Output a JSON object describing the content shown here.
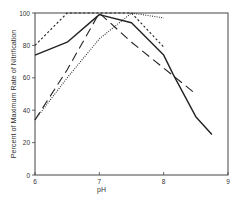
{
  "chart_data": {
    "type": "line",
    "title": "",
    "xlabel": "pH",
    "ylabel": "Percent of Maximum Rate of Nitrification",
    "xlim": [
      6,
      9
    ],
    "ylim": [
      0,
      100
    ],
    "xticks": [
      6,
      7,
      8,
      9
    ],
    "yticks": [
      0,
      20,
      40,
      60,
      80,
      100
    ],
    "grid": false,
    "legend": null,
    "series": [
      {
        "name": "solid",
        "style": "solid",
        "x": [
          6,
          6.5,
          7,
          7.5,
          8,
          8.15,
          8.5,
          8.75
        ],
        "values": [
          74,
          82,
          99,
          94,
          74,
          62,
          36,
          25
        ]
      },
      {
        "name": "short-dash",
        "style": "short-dash",
        "x": [
          6,
          6.5,
          7,
          7.5,
          8
        ],
        "values": [
          80,
          100,
          100,
          100,
          79
        ]
      },
      {
        "name": "long-dash",
        "style": "long-dash",
        "x": [
          6,
          6.5,
          7,
          7.5,
          8,
          8.5
        ],
        "values": [
          34,
          65,
          100,
          82,
          66,
          50
        ]
      },
      {
        "name": "dotted",
        "style": "dotted",
        "x": [
          6,
          6.5,
          7,
          7.5,
          8
        ],
        "values": [
          34,
          60,
          84,
          100,
          97
        ]
      }
    ]
  },
  "axes": {
    "x_title": "pH",
    "y_title": "Percent of Maximum Rate of Nitrification"
  }
}
